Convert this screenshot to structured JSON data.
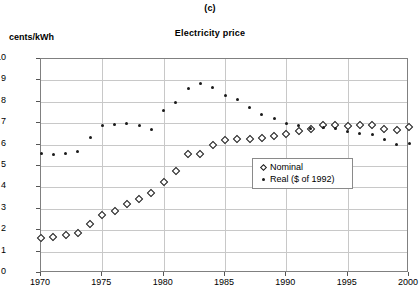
{
  "panel_label": "(c)",
  "axis": {
    "ylabel": "cents/kWh",
    "xlabel": ""
  },
  "legend": {
    "position": "inside-center-right",
    "entries": [
      {
        "label": "Nominal",
        "marker": "open-diamond-icon"
      },
      {
        "label": "Real ($ of 1992)",
        "marker": "filled-dot-icon"
      }
    ]
  },
  "chart_data": {
    "type": "scatter",
    "title": "Electricity  price",
    "subtitle": "(c)",
    "xlabel": "",
    "ylabel": "cents/kWh",
    "xlim": [
      1970,
      2000
    ],
    "ylim": [
      0,
      10
    ],
    "xticks": [
      1970,
      1975,
      1980,
      1985,
      1990,
      1995,
      2000
    ],
    "yticks": [
      0,
      1,
      2,
      3,
      4,
      5,
      6,
      7,
      8,
      9,
      10
    ],
    "grid": true,
    "x": [
      1970,
      1971,
      1972,
      1973,
      1974,
      1975,
      1976,
      1977,
      1978,
      1979,
      1980,
      1981,
      1982,
      1983,
      1984,
      1985,
      1986,
      1987,
      1988,
      1989,
      1990,
      1991,
      1992,
      1993,
      1994,
      1995,
      1996,
      1997,
      1998,
      1999,
      2000
    ],
    "series": [
      {
        "name": "Nominal",
        "marker": "open-diamond",
        "values": [
          1.65,
          1.7,
          1.77,
          1.86,
          2.3,
          2.7,
          2.89,
          3.21,
          3.46,
          3.75,
          4.25,
          4.77,
          5.55,
          5.55,
          6.0,
          6.2,
          6.25,
          6.25,
          6.3,
          6.4,
          6.5,
          6.65,
          6.75,
          6.9,
          6.9,
          6.85,
          6.9,
          6.9,
          6.75,
          6.7,
          6.8
        ]
      },
      {
        "name": "Real ($ of 1992)",
        "marker": "filled-dot",
        "values": [
          5.6,
          5.55,
          5.6,
          5.7,
          6.35,
          6.9,
          6.95,
          7.0,
          6.9,
          6.7,
          7.6,
          7.95,
          8.6,
          8.85,
          8.65,
          8.3,
          8.1,
          7.75,
          7.4,
          7.2,
          7.0,
          6.9,
          6.75,
          6.8,
          6.75,
          6.6,
          6.5,
          6.45,
          6.25,
          6.0,
          6.05
        ]
      }
    ]
  }
}
